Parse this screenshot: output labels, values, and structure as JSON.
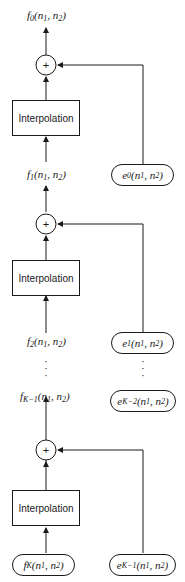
{
  "diagram": {
    "type": "hierarchical-interpolation-pyramid",
    "block_label": "Interpolation",
    "adder_symbol": "+",
    "outputs": {
      "f0": {
        "base": "f",
        "sub": "0",
        "args": "(n",
        "a1": "1",
        "sep": ", n",
        "a2": "2",
        "close": ")"
      },
      "f1": {
        "base": "f",
        "sub": "1",
        "args": "(n",
        "a1": "1",
        "sep": ", n",
        "a2": "2",
        "close": ")"
      },
      "f2": {
        "base": "f",
        "sub": "2",
        "args": "(n",
        "a1": "1",
        "sep": ", n",
        "a2": "2",
        "close": ")"
      },
      "fK1": {
        "base": "f",
        "sub": "K−1",
        "args": "(n",
        "a1": "1",
        "sep": ", n",
        "a2": "2",
        "close": ")"
      },
      "fK": {
        "base": "f",
        "sub": "K",
        "args": "(n",
        "a1": "1",
        "sep": ", n",
        "a2": "2",
        "close": ")"
      }
    },
    "errors": {
      "e0": {
        "base": "e",
        "sub": "0",
        "args": "(n",
        "a1": "1",
        "sep": ", n",
        "a2": "2",
        "close": ")"
      },
      "e1": {
        "base": "e",
        "sub": "1",
        "args": "(n",
        "a1": "1",
        "sep": ", n",
        "a2": "2",
        "close": ")"
      },
      "eK2": {
        "base": "e",
        "sub": "K−2",
        "args": "(n",
        "a1": "1",
        "sep": ", n",
        "a2": "2",
        "close": ")"
      },
      "eK1": {
        "base": "e",
        "sub": "K−1",
        "args": "(n",
        "a1": "1",
        "sep": ", n",
        "a2": "2",
        "close": ")"
      }
    },
    "ellipsis": "⋮"
  }
}
